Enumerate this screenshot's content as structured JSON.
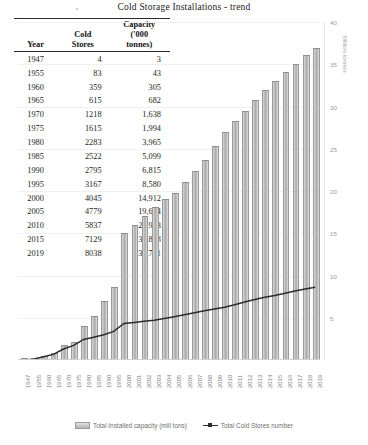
{
  "title": "Cold Storage Installations - trend",
  "table": {
    "headers": [
      "Year",
      "Cold Stores",
      "Capacity ('000 tonnes)"
    ],
    "header_parts": {
      "year": "Year",
      "stores_line1": "Cold",
      "stores_line2": "Stores",
      "cap_line1": "Capacity",
      "cap_line2": "('000",
      "cap_line3": "tonnes)"
    },
    "rows": [
      {
        "year": "1947",
        "stores": "4",
        "capacity": "3"
      },
      {
        "year": "1955",
        "stores": "83",
        "capacity": "43"
      },
      {
        "year": "1960",
        "stores": "359",
        "capacity": "305"
      },
      {
        "year": "1965",
        "stores": "615",
        "capacity": "682"
      },
      {
        "year": "1970",
        "stores": "1218",
        "capacity": "1,638"
      },
      {
        "year": "1975",
        "stores": "1615",
        "capacity": "1,994"
      },
      {
        "year": "1980",
        "stores": "2283",
        "capacity": "3,965"
      },
      {
        "year": "1985",
        "stores": "2522",
        "capacity": "5,099"
      },
      {
        "year": "1990",
        "stores": "2795",
        "capacity": "6,815"
      },
      {
        "year": "1995",
        "stores": "3167",
        "capacity": "8,580"
      },
      {
        "year": "2000",
        "stores": "4045",
        "capacity": "14,912"
      },
      {
        "year": "2005",
        "stores": "4779",
        "capacity": "19,624"
      },
      {
        "year": "2010",
        "stores": "5837",
        "capacity": "26,903"
      },
      {
        "year": "2015",
        "stores": "7129",
        "capacity": "32,868"
      },
      {
        "year": "2019",
        "stores": "8038",
        "capacity": "36,771"
      }
    ]
  },
  "chart_data": {
    "type": "bar",
    "title": "Cold Storage Installations - trend",
    "xlabel": "",
    "ylabel": "Million tonnes",
    "ylim": [
      0,
      40
    ],
    "yticks": [
      0,
      5,
      10,
      15,
      20,
      25,
      30,
      35,
      40
    ],
    "ytick_labels": [
      "0",
      "5",
      "10",
      "15",
      "20",
      "25",
      "30",
      "35",
      "40"
    ],
    "grid": true,
    "legend_position": "bottom",
    "categories": [
      "1947",
      "1955",
      "1960",
      "1965",
      "1970",
      "1975",
      "1980",
      "1985",
      "1990",
      "1995",
      "2000",
      "2001",
      "2002",
      "2003",
      "2004",
      "2005",
      "2006",
      "2007",
      "2008",
      "2009",
      "2010",
      "2011",
      "2012",
      "2013",
      "2014",
      "2015",
      "2016",
      "2017",
      "2018",
      "2019"
    ],
    "series": [
      {
        "name": "Total Installed capacity (mill tons)",
        "type": "bar",
        "axis": "right",
        "unit": "million tonnes",
        "values": [
          0.003,
          0.043,
          0.305,
          0.682,
          1.638,
          1.994,
          3.965,
          5.099,
          6.815,
          8.58,
          14.912,
          15.9,
          16.9,
          18.0,
          18.9,
          19.624,
          21.0,
          22.2,
          23.5,
          25.2,
          26.903,
          28.2,
          29.4,
          30.6,
          31.8,
          32.868,
          34.0,
          34.9,
          36.0,
          36.771
        ]
      },
      {
        "name": "Total Cold Stores number",
        "type": "line",
        "axis": "right-scaled",
        "unit": "number of cold stores",
        "values": [
          4,
          83,
          359,
          615,
          1218,
          1615,
          2283,
          2522,
          2795,
          3167,
          4045,
          4160,
          4280,
          4400,
          4580,
          4779,
          5000,
          5230,
          5450,
          5640,
          5837,
          6120,
          6420,
          6700,
          6930,
          7129,
          7380,
          7620,
          7840,
          8038
        ]
      }
    ],
    "legend": [
      "Total Installed capacity (mill tons)",
      "Total Cold Stores number"
    ]
  },
  "legend": {
    "capacity": "Total Installed capacity (mill tons)",
    "stores": "Total Cold Stores number"
  },
  "axis": {
    "right_title": "Million tonnes"
  }
}
